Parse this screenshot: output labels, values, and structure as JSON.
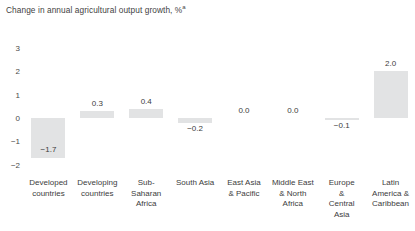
{
  "chart_data": {
    "type": "bar",
    "title": "Change in annual agricultural output growth, %",
    "title_superscript": "a",
    "xlabel": "",
    "ylabel": "",
    "ylim": [
      -2,
      3
    ],
    "yticks": [
      "3",
      "2",
      "1",
      "0",
      "−1",
      "−2"
    ],
    "ytick_values": [
      3,
      2,
      1,
      0,
      -1,
      -2
    ],
    "grid": false,
    "legend": false,
    "bar_color": "#e2e3e4",
    "categories": [
      "Developed countries",
      "Developing countries",
      "Sub-Saharan Africa",
      "South Asia",
      "East Asia & Pacific",
      "Middle East & North Africa",
      "Europe & Central Asia",
      "Latin America & Caribbean"
    ],
    "category_lines": [
      [
        "Developed",
        "countries"
      ],
      [
        "Developing",
        "countries"
      ],
      [
        "Sub-",
        "Saharan",
        "Africa"
      ],
      [
        "South Asia"
      ],
      [
        "East Asia",
        "& Pacific"
      ],
      [
        "Middle East",
        "& North",
        "Africa"
      ],
      [
        "Europe",
        "&",
        "Central",
        "Asia"
      ],
      [
        "Latin",
        "America &",
        "Caribbean"
      ]
    ],
    "values": [
      -1.7,
      0.3,
      0.4,
      -0.2,
      0.0,
      0.0,
      -0.1,
      2.0
    ],
    "value_labels": [
      "−1.7",
      "0.3",
      "0.4",
      "−0.2",
      "0.0",
      "0.0",
      "−0.1",
      "2.0"
    ]
  }
}
